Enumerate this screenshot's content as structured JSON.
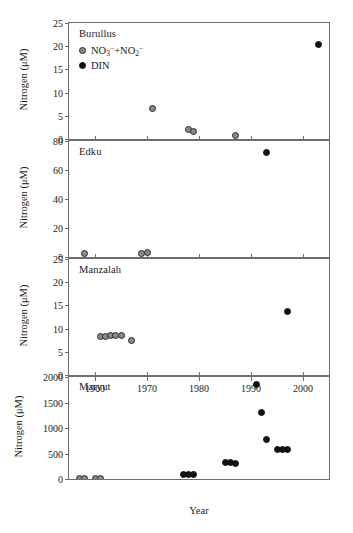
{
  "figure": {
    "xlabel": "Year",
    "ylabel": "Nitrogen (μM)"
  },
  "legend": {
    "series": [
      {
        "key": "no3no2",
        "label": "NO3−+NO2−",
        "marker": "open-circle",
        "color": "#8a8a8a",
        "edge": "#2b2b2b"
      },
      {
        "key": "din",
        "label": "DIN",
        "marker": "filled-circle",
        "color": "#111111",
        "edge": "#111111"
      }
    ]
  },
  "chart_data": [
    {
      "type": "scatter",
      "title": "Burullus",
      "xlabel": "Year",
      "ylabel": "Nitrogen (μM)",
      "xlim": [
        1955,
        2005
      ],
      "ylim": [
        0,
        25
      ],
      "yticks": [
        0,
        5,
        10,
        15,
        20,
        25
      ],
      "xticks": [
        1960,
        1970,
        1980,
        1990,
        2000
      ],
      "grid": false,
      "legend_position": "upper-left-inside",
      "series": [
        {
          "name": "NO3−+NO2−",
          "marker": "open-circle",
          "points": [
            {
              "x": 1971,
              "y": 6.5
            },
            {
              "x": 1978,
              "y": 2.0
            },
            {
              "x": 1979,
              "y": 1.6
            },
            {
              "x": 1987,
              "y": 0.8
            }
          ]
        },
        {
          "name": "DIN",
          "marker": "filled-circle",
          "points": [
            {
              "x": 2003,
              "y": 20.3
            }
          ]
        }
      ]
    },
    {
      "type": "scatter",
      "title": "Edku",
      "xlabel": "Year",
      "ylabel": "Nitrogen (μM)",
      "xlim": [
        1955,
        2005
      ],
      "ylim": [
        0,
        80
      ],
      "yticks": [
        0,
        20,
        40,
        60,
        80
      ],
      "xticks": [
        1960,
        1970,
        1980,
        1990,
        2000
      ],
      "grid": false,
      "series": [
        {
          "name": "NO3−+NO2−",
          "marker": "open-circle",
          "points": [
            {
              "x": 1958,
              "y": 2.5
            },
            {
              "x": 1969,
              "y": 2.5
            },
            {
              "x": 1970,
              "y": 3.2
            }
          ]
        },
        {
          "name": "DIN",
          "marker": "filled-circle",
          "points": [
            {
              "x": 1993,
              "y": 72
            }
          ]
        }
      ]
    },
    {
      "type": "scatter",
      "title": "Manzalah",
      "xlabel": "Year",
      "ylabel": "Nitrogen (μM)",
      "xlim": [
        1955,
        2005
      ],
      "ylim": [
        0,
        25
      ],
      "yticks": [
        0,
        5,
        10,
        15,
        20,
        25
      ],
      "xticks": [
        1960,
        1970,
        1980,
        1990,
        2000
      ],
      "grid": false,
      "series": [
        {
          "name": "NO3−+NO2−",
          "marker": "open-circle",
          "points": [
            {
              "x": 1961,
              "y": 8.2
            },
            {
              "x": 1962,
              "y": 8.4
            },
            {
              "x": 1963,
              "y": 8.6
            },
            {
              "x": 1964,
              "y": 8.6
            },
            {
              "x": 1965,
              "y": 8.5
            },
            {
              "x": 1967,
              "y": 7.4
            }
          ]
        },
        {
          "name": "DIN",
          "marker": "filled-circle",
          "points": [
            {
              "x": 1997,
              "y": 13.7
            }
          ]
        }
      ]
    },
    {
      "type": "scatter",
      "title": "Maryut",
      "xlabel": "Year",
      "ylabel": "Nitrogen (μM)",
      "xlim": [
        1955,
        2005
      ],
      "ylim": [
        0,
        2000
      ],
      "yticks": [
        0,
        500,
        1000,
        1500,
        2000
      ],
      "xticks": [
        1960,
        1970,
        1980,
        1990,
        2000
      ],
      "grid": false,
      "series": [
        {
          "name": "NO3−+NO2−",
          "marker": "open-circle",
          "points": [
            {
              "x": 1957,
              "y": 15
            },
            {
              "x": 1958,
              "y": 15
            },
            {
              "x": 1960,
              "y": 15
            },
            {
              "x": 1961,
              "y": 15
            }
          ]
        },
        {
          "name": "DIN",
          "marker": "filled-circle",
          "points": [
            {
              "x": 1977,
              "y": 85
            },
            {
              "x": 1978,
              "y": 85
            },
            {
              "x": 1979,
              "y": 85
            },
            {
              "x": 1985,
              "y": 330
            },
            {
              "x": 1986,
              "y": 330
            },
            {
              "x": 1987,
              "y": 300
            },
            {
              "x": 1991,
              "y": 1850
            },
            {
              "x": 1992,
              "y": 1310
            },
            {
              "x": 1993,
              "y": 770
            },
            {
              "x": 1995,
              "y": 580
            },
            {
              "x": 1996,
              "y": 585
            },
            {
              "x": 1997,
              "y": 585
            }
          ]
        }
      ]
    }
  ]
}
